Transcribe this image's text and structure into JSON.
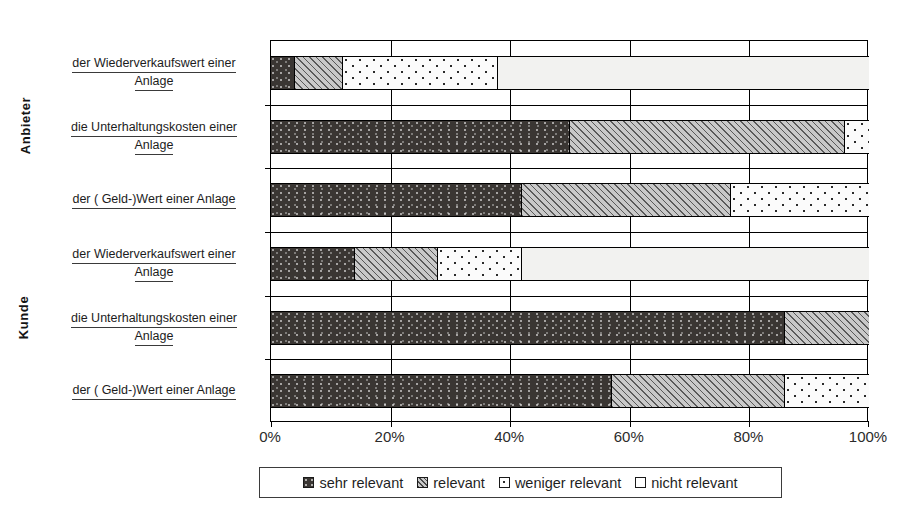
{
  "chart_data": {
    "type": "bar",
    "orientation": "horizontal",
    "stacked": true,
    "stacked_percent": true,
    "title": "",
    "xlabel": "",
    "ylabel": "",
    "xlim": [
      0,
      100
    ],
    "xticks": [
      "0%",
      "20%",
      "40%",
      "60%",
      "80%",
      "100%"
    ],
    "xtick_values": [
      0,
      20,
      40,
      60,
      80,
      100
    ],
    "grid": true,
    "legend_position": "bottom",
    "legend": [
      "sehr relevant",
      "relevant",
      "weniger relevant",
      "nicht relevant"
    ],
    "groups": [
      {
        "name": "Anbieter",
        "category_indices": [
          0,
          1,
          2
        ]
      },
      {
        "name": "Kunde",
        "category_indices": [
          3,
          4,
          5
        ]
      }
    ],
    "categories": [
      "der Wiederverkaufswert einer Anlage",
      "die Unterhaltungskosten einer Anlage",
      "der ( Geld-)Wert einer Anlage",
      "der Wiederverkaufswert einer Anlage",
      "die Unterhaltungskosten einer Anlage",
      "der ( Geld-)Wert einer Anlage"
    ],
    "series": [
      {
        "name": "sehr relevant",
        "values": [
          4,
          50,
          42,
          14,
          86,
          57
        ]
      },
      {
        "name": "relevant",
        "values": [
          8,
          46,
          35,
          14,
          14,
          29
        ]
      },
      {
        "name": "weniger relevant",
        "values": [
          26,
          4,
          23,
          14,
          0,
          14
        ]
      },
      {
        "name": "nicht relevant",
        "values": [
          62,
          0,
          0,
          58,
          0,
          0
        ]
      }
    ]
  },
  "axis_groups": {
    "anbieter": "Anbieter",
    "kunde": "Kunde"
  },
  "category_labels": [
    {
      "line1": "der Wiederverkaufswert einer",
      "line2": "Anlage"
    },
    {
      "line1": "die Unterhaltungskosten einer",
      "line2": "Anlage"
    },
    {
      "line1": "der ( Geld-)Wert einer Anlage",
      "line2": ""
    },
    {
      "line1": "der Wiederverkaufswert einer",
      "line2": "Anlage"
    },
    {
      "line1": "die Unterhaltungskosten einer",
      "line2": "Anlage"
    },
    {
      "line1": "der ( Geld-)Wert einer Anlage",
      "line2": ""
    }
  ],
  "xaxis": {
    "ticks": [
      "0%",
      "20%",
      "40%",
      "60%",
      "80%",
      "100%"
    ]
  },
  "legend": {
    "items": [
      {
        "label": "sehr relevant",
        "swatch": "dark-dotted-swatch"
      },
      {
        "label": "relevant",
        "swatch": "grey-hatched-swatch"
      },
      {
        "label": "weniger relevant",
        "swatch": "white-dotted-swatch"
      },
      {
        "label": "nicht relevant",
        "swatch": "white-plain-swatch"
      }
    ]
  },
  "colors": {
    "sehr_relevant": "#3a3633",
    "relevant": "#c9c9c9",
    "weniger_relevant": "#fbfbfb",
    "nicht_relevant": "#f2f2f0",
    "axis": "#000000",
    "text": "#1a1a1a"
  }
}
